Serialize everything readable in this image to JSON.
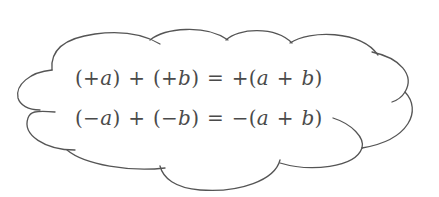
{
  "diagram": {
    "shape": "cloud",
    "stroke_color": "#555555",
    "text_color": "#4a4a4a",
    "equations": [
      {
        "label": "positive-sum",
        "text": "(+a) + (+b) = +(a + b)"
      },
      {
        "label": "negative-sum",
        "text": "(−a) + (−b) = −(a + b)"
      }
    ]
  }
}
